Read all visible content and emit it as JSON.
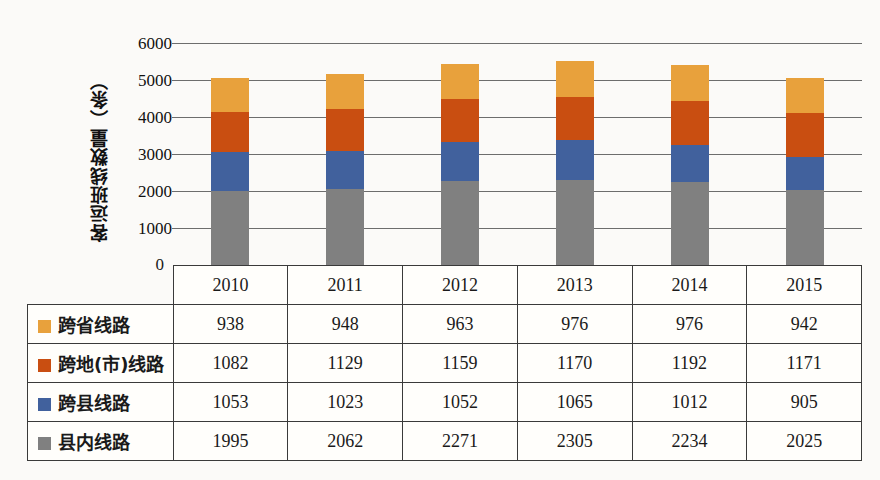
{
  "chart_data": {
    "type": "bar",
    "subtype": "stacked-bar-with-data-table",
    "title": "",
    "xlabel": "",
    "ylabel": "客运班线数量（条）",
    "categories": [
      "2010",
      "2011",
      "2012",
      "2013",
      "2014",
      "2015"
    ],
    "ylim": [
      0,
      6000
    ],
    "yticks": [
      "0",
      "1000",
      "2000",
      "3000",
      "4000",
      "5000",
      "6000"
    ],
    "ytick_values": [
      0,
      1000,
      2000,
      3000,
      4000,
      5000,
      6000
    ],
    "grid": true,
    "legend_position": "table-left-column",
    "stack_order_bottom_to_top": [
      "县内线路",
      "跨县线路",
      "跨地(市)线路",
      "跨省线路"
    ],
    "series": [
      {
        "name": "跨省线路",
        "color": "#E8A13C",
        "values": [
          938,
          948,
          963,
          976,
          976,
          942
        ]
      },
      {
        "name": "跨地(市)线路",
        "color": "#C94E11",
        "values": [
          1082,
          1129,
          1159,
          1170,
          1192,
          1171
        ]
      },
      {
        "name": "跨县线路",
        "color": "#41619D",
        "values": [
          1053,
          1023,
          1052,
          1065,
          1012,
          905
        ]
      },
      {
        "name": "县内线路",
        "color": "#808080",
        "values": [
          1995,
          2062,
          2271,
          2305,
          2234,
          2025
        ]
      }
    ],
    "totals": [
      5068,
      5162,
      5445,
      5516,
      5414,
      5043
    ]
  },
  "table": {
    "header_row": [
      "",
      "2010",
      "2011",
      "2012",
      "2013",
      "2014",
      "2015"
    ],
    "rows": [
      {
        "label": "跨省线路",
        "color": "#E8A13C",
        "cells": [
          "938",
          "948",
          "963",
          "976",
          "976",
          "942"
        ]
      },
      {
        "label": "跨地(市)线路",
        "color": "#C94E11",
        "cells": [
          "1082",
          "1129",
          "1159",
          "1170",
          "1192",
          "1171"
        ]
      },
      {
        "label": "跨县线路",
        "color": "#41619D",
        "cells": [
          "1053",
          "1023",
          "1052",
          "1065",
          "1012",
          "905"
        ]
      },
      {
        "label": "县内线路",
        "color": "#808080",
        "cells": [
          "1995",
          "2062",
          "2271",
          "2305",
          "2234",
          "2025"
        ]
      }
    ]
  },
  "axis": {
    "y_label": "客运班线数量（条）",
    "zero_label": "0",
    "ticks": [
      "6000",
      "5000",
      "4000",
      "3000",
      "2000",
      "1000"
    ]
  }
}
